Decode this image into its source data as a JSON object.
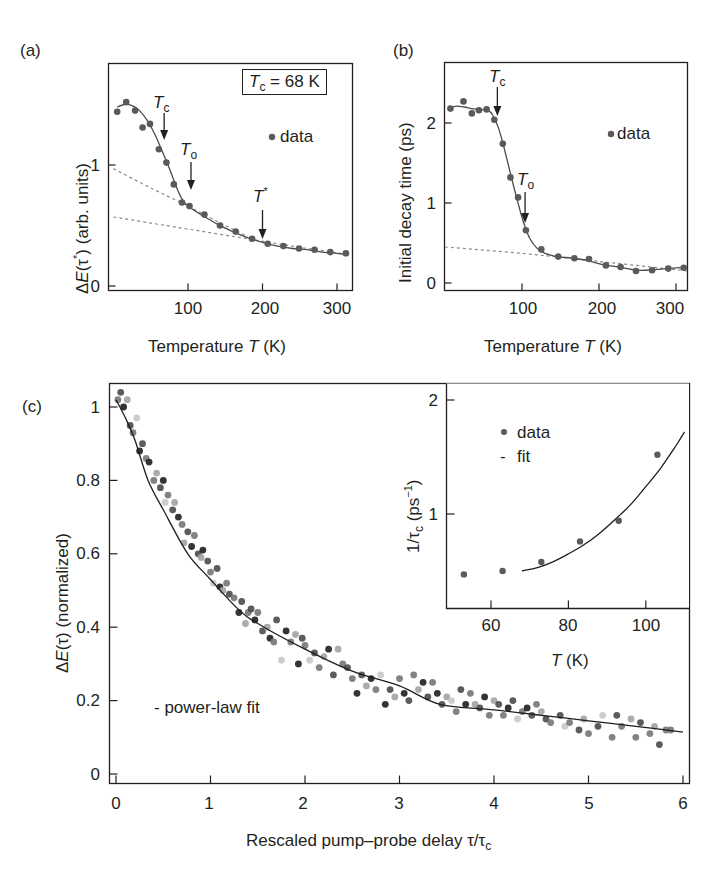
{
  "figure": {
    "panel_labels": [
      "(a)",
      "(b)",
      "(c)"
    ]
  },
  "panel_a": {
    "label": "(a)",
    "ylabel_prefix": "ΔE(τ*)",
    "ylabel_suffix": " (arb. units)",
    "xlabel_prefix": "Temperature ",
    "xlabel_var": "T",
    "xlabel_suffix": " (K)",
    "box_text_var": "T",
    "box_text_sub": "c",
    "box_text_value": " = 68 K",
    "legend_data": "data",
    "x_ticks": [
      "100",
      "200",
      "300"
    ],
    "y_ticks": [
      "0",
      "1"
    ],
    "annotations": [
      {
        "var": "T",
        "sub": "c",
        "sup": ""
      },
      {
        "var": "T",
        "sub": "o",
        "sup": ""
      },
      {
        "var": "T",
        "sub": "",
        "sup": "*"
      }
    ]
  },
  "panel_b": {
    "label": "(b)",
    "ylabel": "Initial decay time (ps)",
    "xlabel_prefix": "Temperature ",
    "xlabel_var": "T",
    "xlabel_suffix": " (K)",
    "legend_data": "data",
    "x_ticks": [
      "100",
      "200",
      "300"
    ],
    "y_ticks": [
      "0",
      "1",
      "2"
    ],
    "annotations": [
      {
        "var": "T",
        "sub": "c"
      },
      {
        "var": "T",
        "sub": "o"
      }
    ]
  },
  "panel_c": {
    "label": "(c)",
    "ylabel_prefix": "ΔE(τ)",
    "ylabel_suffix": " (normalized)",
    "xlabel_prefix": "Rescaled pump–probe delay ",
    "xlabel_var": "τ/τ",
    "xlabel_sub": "c",
    "legend_fit": "- power-law fit",
    "x_ticks": [
      "0",
      "1",
      "2",
      "3",
      "4",
      "5",
      "6"
    ],
    "y_ticks": [
      "0",
      "0.2",
      "0.4",
      "0.6",
      "0.8",
      "1"
    ],
    "inset": {
      "ylabel_prefix": "1/τ",
      "ylabel_sub": "c",
      "ylabel_suffix": " (ps",
      "ylabel_sup": "−1",
      "ylabel_close": ")",
      "xlabel_var": "T",
      "xlabel_suffix": " (K)",
      "legend_data": "data",
      "legend_fit": "fit",
      "x_ticks": [
        "60",
        "80",
        "100"
      ],
      "y_ticks": [
        "1",
        "2"
      ]
    }
  },
  "colors": {
    "ink": "#231f20",
    "marker": "#5a5a5a",
    "dashed": "#8a8a8a",
    "scatter_shades": [
      "#1e1e1e",
      "#4a4a4a",
      "#767676",
      "#a3a3a3",
      "#c8c8c8"
    ]
  },
  "chart_data": [
    {
      "type": "scatter",
      "panel": "a",
      "title": "",
      "xlabel": "Temperature T (K)",
      "ylabel": "ΔE(τ*) (arb. units)",
      "xlim": [
        0,
        320
      ],
      "ylim": [
        -0.05,
        1.8
      ],
      "x_ticks": [
        100,
        200,
        300
      ],
      "y_ticks": [
        0,
        1
      ],
      "legend": [
        "data"
      ],
      "box_annotation": "Tc = 68 K",
      "marker_annotations": [
        {
          "label": "Tc",
          "x": 68
        },
        {
          "label": "To",
          "x": 104
        },
        {
          "label": "T*",
          "x": 200
        }
      ],
      "series": [
        {
          "name": "data",
          "kind": "points",
          "x": [
            5,
            17,
            29,
            39,
            49,
            61,
            71,
            81,
            92,
            102,
            122,
            143,
            164,
            186,
            207,
            228,
            249,
            270,
            291,
            312
          ],
          "y": [
            1.44,
            1.52,
            1.45,
            1.31,
            1.34,
            1.13,
            1.02,
            0.84,
            0.69,
            0.66,
            0.59,
            0.5,
            0.45,
            0.39,
            0.35,
            0.33,
            0.31,
            0.3,
            0.28,
            0.27
          ]
        },
        {
          "name": "fit",
          "kind": "line",
          "x": [
            5,
            15,
            25,
            35,
            45,
            55,
            65,
            75,
            85,
            92,
            100,
            120,
            140,
            160,
            180,
            200,
            220,
            240,
            260,
            280,
            300,
            315
          ],
          "y": [
            1.48,
            1.5,
            1.49,
            1.45,
            1.37,
            1.26,
            1.12,
            0.97,
            0.81,
            0.72,
            0.66,
            0.58,
            0.51,
            0.45,
            0.4,
            0.36,
            0.33,
            0.31,
            0.3,
            0.28,
            0.27,
            0.26
          ]
        },
        {
          "name": "dashed-upper",
          "kind": "dashed",
          "x": [
            0,
            50,
            100,
            150,
            180
          ],
          "y": [
            0.97,
            0.81,
            0.66,
            0.5,
            0.41
          ]
        },
        {
          "name": "dashed-lower",
          "kind": "dashed",
          "x": [
            0,
            50,
            100,
            150,
            200,
            250,
            315
          ],
          "y": [
            0.57,
            0.52,
            0.47,
            0.42,
            0.37,
            0.32,
            0.26
          ]
        }
      ]
    },
    {
      "type": "scatter",
      "panel": "b",
      "title": "",
      "xlabel": "Temperature T (K)",
      "ylabel": "Initial decay time (ps)",
      "xlim": [
        0,
        315
      ],
      "ylim": [
        -0.1,
        2.75
      ],
      "x_ticks": [
        100,
        200,
        300
      ],
      "y_ticks": [
        0,
        1,
        2
      ],
      "legend": [
        "data"
      ],
      "marker_annotations": [
        {
          "label": "Tc",
          "x": 68
        },
        {
          "label": "To",
          "x": 104
        }
      ],
      "series": [
        {
          "name": "data",
          "kind": "points",
          "x": [
            7,
            24,
            35,
            44,
            54,
            64,
            75,
            85,
            95,
            105,
            125,
            147,
            168,
            187,
            209,
            228,
            248,
            269,
            290,
            310
          ],
          "y": [
            2.18,
            2.27,
            2.12,
            2.16,
            2.17,
            2.04,
            1.74,
            1.32,
            1.07,
            0.66,
            0.42,
            0.33,
            0.31,
            0.3,
            0.22,
            0.2,
            0.15,
            0.16,
            0.18,
            0.19
          ]
        },
        {
          "name": "fit",
          "kind": "line",
          "x": [
            5,
            15,
            25,
            35,
            45,
            55,
            62,
            70,
            78,
            86,
            94,
            102,
            110,
            120,
            130,
            145,
            165,
            185,
            205,
            225,
            250,
            275,
            300,
            315
          ],
          "y": [
            2.19,
            2.21,
            2.2,
            2.18,
            2.17,
            2.16,
            2.1,
            1.92,
            1.64,
            1.33,
            1.03,
            0.76,
            0.56,
            0.43,
            0.37,
            0.33,
            0.31,
            0.28,
            0.23,
            0.2,
            0.16,
            0.17,
            0.19,
            0.19
          ]
        },
        {
          "name": "dashed",
          "kind": "dashed",
          "x": [
            0,
            100,
            200,
            315
          ],
          "y": [
            0.45,
            0.37,
            0.27,
            0.15
          ]
        }
      ]
    },
    {
      "type": "scatter",
      "panel": "c",
      "title": "",
      "xlabel": "Rescaled pump–probe delay τ/τc",
      "ylabel": "ΔE(τ) (normalized)",
      "xlim": [
        -0.07,
        6.07
      ],
      "ylim": [
        -0.025,
        1.06
      ],
      "x_ticks": [
        0,
        1,
        2,
        3,
        4,
        5,
        6
      ],
      "y_ticks": [
        0,
        0.2,
        0.4,
        0.6,
        0.8,
        1
      ],
      "legend": [
        "power-law fit"
      ],
      "series": [
        {
          "name": "power-law fit",
          "kind": "line",
          "x": [
            0,
            0.1,
            0.2,
            0.34,
            0.5,
            0.76,
            1.0,
            1.29,
            1.5,
            2.0,
            2.5,
            3.0,
            3.43,
            4.0,
            4.5,
            5.0,
            5.5,
            6.0
          ],
          "y": [
            1.02,
            0.97,
            0.91,
            0.8,
            0.72,
            0.6,
            0.53,
            0.45,
            0.41,
            0.34,
            0.28,
            0.24,
            0.19,
            0.175,
            0.16,
            0.145,
            0.13,
            0.114
          ]
        },
        {
          "name": "data (multiple temperatures, gray shades)",
          "kind": "points",
          "x": [
            0.02,
            0.05,
            0.08,
            0.12,
            0.15,
            0.18,
            0.22,
            0.25,
            0.28,
            0.32,
            0.35,
            0.4,
            0.43,
            0.47,
            0.5,
            0.52,
            0.55,
            0.6,
            0.62,
            0.66,
            0.7,
            0.72,
            0.76,
            0.8,
            0.83,
            0.87,
            0.9,
            0.92,
            0.97,
            1.0,
            1.03,
            1.07,
            1.1,
            1.13,
            1.17,
            1.2,
            1.25,
            1.3,
            1.33,
            1.37,
            1.4,
            1.43,
            1.47,
            1.5,
            1.55,
            1.6,
            1.63,
            1.67,
            1.7,
            1.75,
            1.8,
            1.85,
            1.9,
            1.93,
            1.97,
            2.0,
            2.05,
            2.1,
            2.15,
            2.2,
            2.25,
            2.3,
            2.35,
            2.4,
            2.45,
            2.5,
            2.55,
            2.6,
            2.65,
            2.7,
            2.75,
            2.8,
            2.85,
            2.9,
            2.95,
            3.0,
            3.05,
            3.1,
            3.15,
            3.2,
            3.25,
            3.3,
            3.35,
            3.4,
            3.45,
            3.5,
            3.55,
            3.6,
            3.65,
            3.7,
            3.75,
            3.8,
            3.85,
            3.9,
            3.95,
            4.0,
            4.05,
            4.1,
            4.15,
            4.2,
            4.25,
            4.3,
            4.35,
            4.4,
            4.45,
            4.5,
            4.55,
            4.6,
            4.7,
            4.75,
            4.8,
            4.9,
            4.95,
            5.0,
            5.1,
            5.15,
            5.25,
            5.3,
            5.35,
            5.45,
            5.5,
            5.55,
            5.65,
            5.7,
            5.75,
            5.82,
            5.87
          ],
          "y": [
            1.02,
            1.04,
            1.0,
            1.02,
            0.95,
            0.93,
            0.97,
            0.88,
            0.9,
            0.86,
            0.85,
            0.8,
            0.82,
            0.78,
            0.8,
            0.74,
            0.76,
            0.72,
            0.74,
            0.7,
            0.68,
            0.63,
            0.66,
            0.62,
            0.65,
            0.6,
            0.59,
            0.61,
            0.58,
            0.55,
            0.52,
            0.56,
            0.51,
            0.5,
            0.52,
            0.49,
            0.48,
            0.44,
            0.47,
            0.41,
            0.44,
            0.45,
            0.42,
            0.44,
            0.39,
            0.4,
            0.37,
            0.36,
            0.42,
            0.31,
            0.39,
            0.36,
            0.38,
            0.3,
            0.37,
            0.35,
            0.31,
            0.33,
            0.29,
            0.32,
            0.34,
            0.27,
            0.34,
            0.3,
            0.29,
            0.26,
            0.22,
            0.27,
            0.24,
            0.26,
            0.23,
            0.27,
            0.19,
            0.23,
            0.21,
            0.26,
            0.22,
            0.2,
            0.27,
            0.23,
            0.25,
            0.21,
            0.25,
            0.22,
            0.19,
            0.21,
            0.2,
            0.17,
            0.23,
            0.19,
            0.22,
            0.19,
            0.18,
            0.21,
            0.16,
            0.2,
            0.19,
            0.16,
            0.18,
            0.2,
            0.15,
            0.17,
            0.18,
            0.16,
            0.19,
            0.17,
            0.15,
            0.14,
            0.16,
            0.13,
            0.14,
            0.12,
            0.15,
            0.11,
            0.13,
            0.16,
            0.1,
            0.16,
            0.13,
            0.15,
            0.1,
            0.14,
            0.11,
            0.13,
            0.08,
            0.12,
            0.12
          ],
          "shade": [
            2,
            1,
            0,
            3,
            1,
            2,
            4,
            0,
            1,
            2,
            0,
            2,
            3,
            1,
            0,
            4,
            2,
            1,
            3,
            0,
            2,
            3,
            1,
            0,
            2,
            1,
            3,
            0,
            1,
            2,
            4,
            1,
            0,
            3,
            2,
            1,
            2,
            0,
            1,
            3,
            2,
            1,
            0,
            2,
            1,
            3,
            0,
            2,
            1,
            4,
            0,
            2,
            3,
            0,
            1,
            2,
            4,
            1,
            2,
            3,
            0,
            1,
            3,
            2,
            1,
            2,
            0,
            1,
            3,
            0,
            2,
            4,
            0,
            1,
            3,
            2,
            0,
            1,
            2,
            3,
            0,
            1,
            2,
            0,
            1,
            3,
            4,
            2,
            1,
            0,
            2,
            3,
            1,
            0,
            2,
            3,
            1,
            2,
            0,
            1,
            4,
            2,
            0,
            1,
            2,
            3,
            1,
            2,
            1,
            4,
            2,
            1,
            3,
            2,
            1,
            4,
            2,
            1,
            2,
            3,
            2,
            1,
            2,
            3,
            1,
            2,
            2
          ]
        }
      ],
      "inset": {
        "type": "scatter",
        "xlabel": "T (K)",
        "ylabel": "1/τc (ps⁻¹)",
        "xlim": [
          48,
          111
        ],
        "ylim": [
          0.18,
          2.12
        ],
        "x_ticks": [
          60,
          80,
          100
        ],
        "y_ticks": [
          1,
          2
        ],
        "legend": [
          "data",
          "fit"
        ],
        "series": [
          {
            "name": "data",
            "kind": "points",
            "x": [
              53,
              63,
              73,
              83,
              93,
              103
            ],
            "y": [
              0.47,
              0.5,
              0.58,
              0.76,
              0.94,
              1.52
            ]
          },
          {
            "name": "fit",
            "kind": "line",
            "x": [
              68,
              72,
              76,
              80,
              84,
              88,
              92,
              96,
              100,
              104,
              108,
              110
            ],
            "y": [
              0.5,
              0.53,
              0.58,
              0.65,
              0.73,
              0.83,
              0.95,
              1.08,
              1.24,
              1.41,
              1.61,
              1.72
            ]
          }
        ]
      }
    }
  ]
}
